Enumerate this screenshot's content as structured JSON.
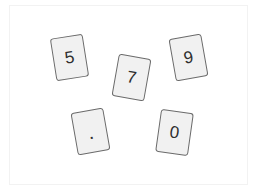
{
  "board": {
    "cards": [
      {
        "label": "5",
        "x": 69,
        "y": 57,
        "rotation": -9
      },
      {
        "label": "7",
        "x": 131,
        "y": 77,
        "rotation": 10
      },
      {
        "label": "9",
        "x": 188,
        "y": 57,
        "rotation": -10
      },
      {
        "label": ".",
        "x": 90,
        "y": 131,
        "rotation": -10
      },
      {
        "label": "0",
        "x": 174,
        "y": 132,
        "rotation": 8
      }
    ]
  },
  "colors": {
    "card_fill": "#f1f1f1",
    "card_border": "#6a6a6a",
    "card_text": "#2e2e2e",
    "board_border": "#f2f2f2",
    "background": "#ffffff"
  }
}
